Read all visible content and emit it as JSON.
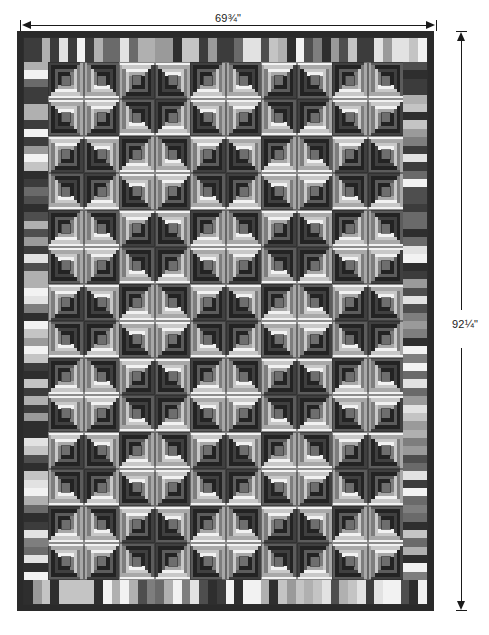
{
  "diagram": {
    "kind": "quilt-layout-diagram",
    "caption": ""
  },
  "dimensions": {
    "top": {
      "label": "69¾\"",
      "whole": "69",
      "numerator": "3",
      "denominator": "4",
      "unit": "\"",
      "orientation": "horizontal",
      "arrow_style": "double-headed"
    },
    "right": {
      "label": "92¼\"",
      "whole": "92",
      "numerator": "1",
      "denominator": "4",
      "unit": "\"",
      "orientation": "vertical",
      "arrow_style": "double-headed"
    }
  },
  "colors": {
    "binding_dark": "#2c2c2c",
    "log_darkest": "#232323",
    "log_dark": "#404040",
    "log_mid_dark": "#5c5c5c",
    "log_mid": "#7d7d7d",
    "log_light": "#a8a8a8",
    "log_lighter": "#c8c8c8",
    "log_white": "#f2f2f2",
    "center_dark": "#6e6e6e",
    "sash_dark": "#262626",
    "page_background": "#ffffff",
    "annotation": "#1a1a1a"
  },
  "quilt": {
    "outer_border": {
      "name": "binding",
      "width_px": 6,
      "color": "#2a2a2a"
    },
    "piano_key_border": {
      "name": "piano-key-border",
      "width_px": 24,
      "strip_count_top": 46,
      "strip_count_side": 62,
      "palette": [
        "#f2f2f2",
        "#9a9a9a",
        "#2e2e2e",
        "#c4c4c4",
        "#6a6a6a",
        "#3c3c3c",
        "#b0b0b0",
        "#4e4e4e",
        "#e2e2e2",
        "#7e7e7e"
      ]
    },
    "block_field": {
      "name": "log-cabin-field",
      "columns": 10,
      "rows": 14,
      "block_name": "log-cabin-block",
      "setting": "barn-raising",
      "rings": 4,
      "center_color": "#6e6e6e"
    }
  },
  "legend_note": ""
}
